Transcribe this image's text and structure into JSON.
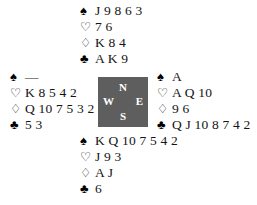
{
  "diagram": {
    "type": "bridge-deal",
    "background_color": "#ffffff",
    "text_color": "#141414"
  },
  "suits": {
    "spade": {
      "glyph": "♠",
      "name": "spade-suit-symbol",
      "filled": true
    },
    "heart": {
      "glyph": "♡",
      "name": "heart-suit-symbol",
      "filled": false
    },
    "diamond": {
      "glyph": "♢",
      "name": "diamond-suit-symbol",
      "filled": false
    },
    "club": {
      "glyph": "♣",
      "name": "club-suit-symbol",
      "filled": true
    }
  },
  "compass": {
    "background_color": "#5e5e5e",
    "text_color": "#ffffff",
    "north": "N",
    "west": "W",
    "east": "E",
    "south": "S"
  },
  "hands": {
    "north": {
      "position_label": "North",
      "spades": "J 9 8 6 3",
      "hearts": "7 6",
      "diamonds": "K 8 4",
      "clubs": "A K 9"
    },
    "west": {
      "position_label": "West",
      "spades": "—",
      "hearts": "K 8 5 4 2",
      "diamonds": "Q 10 7 5 3 2",
      "clubs": "5 3"
    },
    "east": {
      "position_label": "East",
      "spades": "A",
      "hearts": "A Q 10",
      "diamonds": "9 6",
      "clubs": "Q J 10 8 7 4 2"
    },
    "south": {
      "position_label": "South",
      "spades": "K Q 10 7 5 4 2",
      "hearts": "J 9 3",
      "diamonds": "A J",
      "clubs": "6"
    }
  }
}
